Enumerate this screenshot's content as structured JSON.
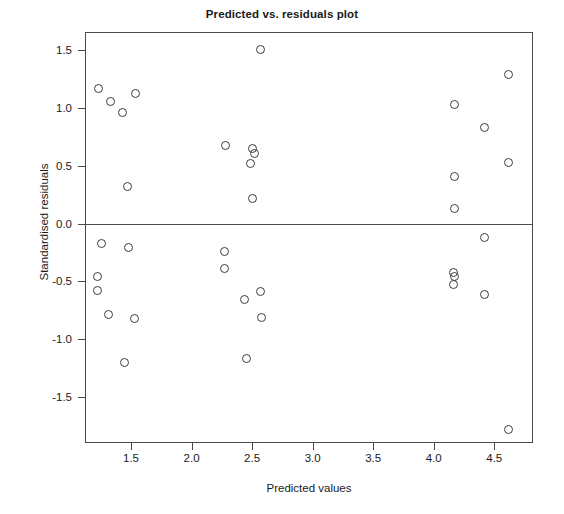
{
  "chart_data": {
    "type": "scatter",
    "title": "Predicted vs. residuals plot",
    "xlabel": "Predicted values",
    "ylabel": "Standardised residuals",
    "xlim": [
      1.12,
      4.82
    ],
    "ylim": [
      -1.9,
      1.66
    ],
    "grid": false,
    "legend": null,
    "xticks": [
      1.5,
      2.0,
      2.5,
      3.0,
      3.5,
      4.0,
      4.5
    ],
    "xticklabels": [
      "1.5",
      "2.0",
      "2.5",
      "3.0",
      "3.5",
      "4.0",
      "4.5"
    ],
    "yticks": [
      1.5,
      1.0,
      0.5,
      0.0,
      -0.5,
      -1.0,
      -1.5
    ],
    "yticklabels": [
      "1.5",
      "1.0",
      "0.5",
      "0.0",
      "-0.5",
      "-1.0",
      "-1.5"
    ],
    "reference_line": {
      "orientation": "horizontal",
      "y": 0.0
    },
    "marker": {
      "shape": "open-circle",
      "color": "#3c3c3c",
      "size": 9
    },
    "points": [
      {
        "x": 1.23,
        "y": 1.17
      },
      {
        "x": 1.33,
        "y": 1.06
      },
      {
        "x": 1.43,
        "y": 0.96
      },
      {
        "x": 1.54,
        "y": 1.13
      },
      {
        "x": 1.47,
        "y": 0.32
      },
      {
        "x": 2.57,
        "y": 1.51
      },
      {
        "x": 2.28,
        "y": 0.68
      },
      {
        "x": 2.5,
        "y": 0.65
      },
      {
        "x": 2.52,
        "y": 0.61
      },
      {
        "x": 2.49,
        "y": 0.52
      },
      {
        "x": 2.5,
        "y": 0.22
      },
      {
        "x": 4.17,
        "y": 1.03
      },
      {
        "x": 4.42,
        "y": 0.83
      },
      {
        "x": 4.62,
        "y": 1.29
      },
      {
        "x": 4.62,
        "y": 0.53
      },
      {
        "x": 4.17,
        "y": 0.41
      },
      {
        "x": 4.17,
        "y": 0.13
      },
      {
        "x": 1.26,
        "y": -0.17
      },
      {
        "x": 1.48,
        "y": -0.21
      },
      {
        "x": 1.22,
        "y": -0.46
      },
      {
        "x": 1.22,
        "y": -0.58
      },
      {
        "x": 1.31,
        "y": -0.79
      },
      {
        "x": 1.53,
        "y": -0.82
      },
      {
        "x": 1.45,
        "y": -1.2
      },
      {
        "x": 2.27,
        "y": -0.24
      },
      {
        "x": 2.27,
        "y": -0.39
      },
      {
        "x": 2.44,
        "y": -0.66
      },
      {
        "x": 2.57,
        "y": -0.59
      },
      {
        "x": 2.58,
        "y": -0.81
      },
      {
        "x": 2.45,
        "y": -1.17
      },
      {
        "x": 4.42,
        "y": -0.12
      },
      {
        "x": 4.16,
        "y": -0.42
      },
      {
        "x": 4.17,
        "y": -0.46
      },
      {
        "x": 4.16,
        "y": -0.53
      },
      {
        "x": 4.42,
        "y": -0.61
      },
      {
        "x": 4.62,
        "y": -1.78
      }
    ]
  }
}
